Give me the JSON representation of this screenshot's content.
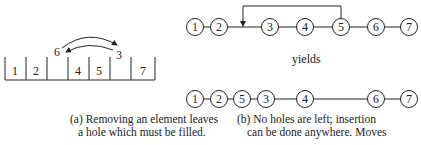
{
  "array_diagram": {
    "cells": [
      "1",
      "2",
      "",
      "4",
      "5",
      "",
      "7"
    ],
    "floating_labels": {
      "left": "6",
      "right": "3"
    },
    "caption_line1": "(a) Removing an element leaves",
    "caption_line2": "a hole which must be filled."
  },
  "list_diagram": {
    "top_nodes": [
      "1",
      "2",
      "3",
      "4",
      "5",
      "6",
      "7"
    ],
    "yields_label": "yields",
    "bottom_nodes": [
      "1",
      "2",
      "5",
      "3",
      "4",
      "6",
      "7"
    ],
    "caption_line1": "(b) No holes are left; insertion",
    "caption_line2": "can be done anywhere. Moves"
  }
}
